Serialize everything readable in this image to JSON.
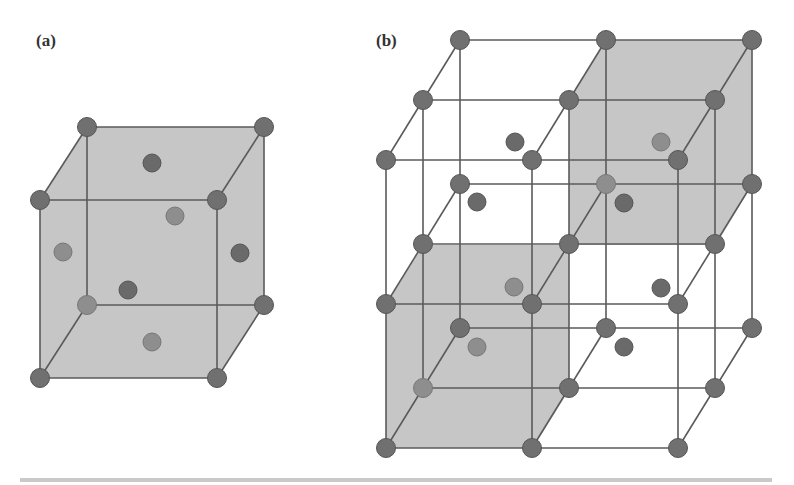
{
  "figure": {
    "panels": [
      {
        "label": "(a)",
        "description": "Face-centered cubic unit cell",
        "cube": {
          "corners": {
            "back_top_left": [
              87,
              127
            ],
            "back_top_right": [
              264,
              127
            ],
            "front_top_left": [
              40,
              200
            ],
            "front_top_right": [
              217,
              200
            ],
            "front_bottom_left": [
              40,
              378
            ],
            "front_bottom_right": [
              217,
              378
            ],
            "back_bottom_left": [
              87,
              305
            ],
            "back_bottom_right": [
              264,
              305
            ]
          },
          "face_centers": [
            {
              "name": "top",
              "pos": [
                152,
                163
              ],
              "tone": "dark"
            },
            {
              "name": "front",
              "pos": [
                175,
                216
              ],
              "tone": "light"
            },
            {
              "name": "left",
              "pos": [
                63,
                252
              ],
              "tone": "light"
            },
            {
              "name": "right",
              "pos": [
                240,
                253
              ],
              "tone": "dark"
            },
            {
              "name": "back",
              "pos": [
                128,
                290
              ],
              "tone": "dark"
            },
            {
              "name": "bottom",
              "pos": [
                152,
                342
              ],
              "tone": "light"
            }
          ]
        }
      },
      {
        "label": "(b)",
        "description": "2x2x2 block of unit cells with two shaded sub-cells",
        "lattice": {
          "origin_front_top_left": [
            386,
            160
          ],
          "step_x": 146,
          "step_y": 144,
          "depth_dx": 37,
          "depth_dy": -60
        },
        "shaded_regions": [
          {
            "name": "upper-right-back-cell",
            "points": [
              [
                569,
                100
              ],
              [
                606,
                40
              ],
              [
                752,
                40
              ],
              [
                752,
                185
              ],
              [
                716,
                245
              ],
              [
                569,
                245
              ]
            ]
          },
          {
            "name": "lower-left-front-cell",
            "points": [
              [
                386,
                305
              ],
              [
                423,
                245
              ],
              [
                569,
                245
              ],
              [
                569,
                390
              ],
              [
                533,
                448
              ],
              [
                386,
                448
              ]
            ]
          }
        ],
        "interior_atoms": [
          {
            "pos": [
              515,
              142
            ],
            "tone": "dark"
          },
          {
            "pos": [
              477,
              202
            ],
            "tone": "dark"
          },
          {
            "pos": [
              661,
              142
            ],
            "tone": "light"
          },
          {
            "pos": [
              624,
              203
            ],
            "tone": "dark"
          },
          {
            "pos": [
              514,
              287
            ],
            "tone": "light"
          },
          {
            "pos": [
              477,
              347
            ],
            "tone": "light"
          },
          {
            "pos": [
              661,
              288
            ],
            "tone": "dark"
          },
          {
            "pos": [
              624,
              347
            ],
            "tone": "dark"
          }
        ]
      }
    ],
    "colors": {
      "shade": "#c6c6c6",
      "edge": "#5a5a5a",
      "atom_dark": "#6a6a6a",
      "atom_light": "#8e8e8e",
      "footer_bar": "#c9c9c9"
    }
  }
}
